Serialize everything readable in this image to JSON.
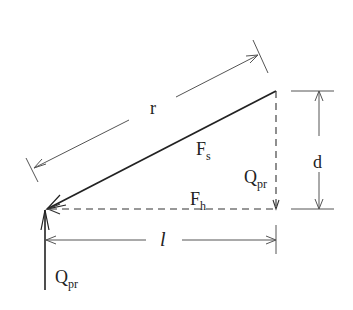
{
  "diagram": {
    "type": "force-resolution",
    "labels": {
      "r": "r",
      "d": "d",
      "l": "l",
      "Fs_main": "F",
      "Fs_sub": "s",
      "Fh_main": "F",
      "Fh_sub": "h",
      "Qpr_right_main": "Q",
      "Qpr_right_sub": "pr",
      "Qpr_bottom_main": "Q",
      "Qpr_bottom_sub": "pr"
    },
    "colors": {
      "stroke": "#222222",
      "thin": "#555555",
      "background": "#ffffff"
    }
  }
}
